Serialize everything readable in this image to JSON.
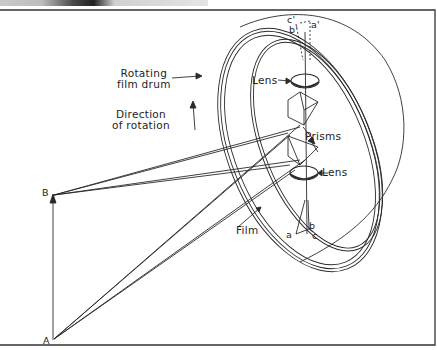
{
  "figure": {
    "title": "",
    "labels": {
      "drum": [
        "Rotating",
        "film drum"
      ],
      "rotation": [
        "Direction",
        "of rotation"
      ],
      "lens_top": "Lens",
      "lens_bottom": "Lens",
      "prisms": "Prisms",
      "film": "Film",
      "point_A": "A",
      "point_B": "B",
      "image_a": "a",
      "image_b": "b",
      "image_c": "c",
      "image_a_prime": "a'",
      "image_b_prime": "b'",
      "image_c_prime": "c'"
    },
    "colors": {
      "line": "#2a2a2a",
      "background": "#ffffff",
      "frame": "#333333"
    }
  }
}
